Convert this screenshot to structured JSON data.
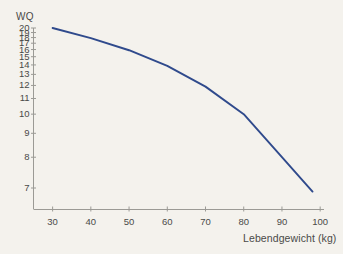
{
  "chart_data": {
    "type": "line",
    "title": "",
    "subtitle": "",
    "xlabel": "Lebendgewicht (kg)",
    "ylabel": "WQ",
    "xlim": [
      25,
      101
    ],
    "ylim": [
      6.5,
      20.4
    ],
    "grid": false,
    "legend": null,
    "y_scale": "reciprocal",
    "x_scale": "linear",
    "xticks": [
      30,
      40,
      50,
      60,
      70,
      80,
      90,
      100
    ],
    "xtick_labels": [
      "30",
      "40",
      "50",
      "60",
      "70",
      "80",
      "90",
      "100"
    ],
    "yticks": [
      20,
      19,
      18,
      17,
      16,
      15,
      14,
      13,
      12,
      11,
      10,
      9,
      8,
      7
    ],
    "ytick_labels": [
      "20",
      "19",
      "18",
      "17",
      "16",
      "15",
      "14",
      "13",
      "12",
      "11",
      "10",
      "9",
      "8",
      "7"
    ],
    "series": [
      {
        "name": "WQ",
        "color": "#2f4a8c",
        "x": [
          30,
          40,
          50,
          60,
          70,
          80,
          90,
          98
        ],
        "values": [
          20.0,
          17.9,
          15.9,
          13.9,
          11.9,
          10.0,
          8.0,
          6.9
        ]
      }
    ],
    "annotations": []
  },
  "axis": {
    "y_title": "WQ",
    "x_title": "Lebendgewicht (kg)"
  },
  "style": {
    "background": "#f4f2ed",
    "axis_color": "#9b9a95",
    "text_color": "#4a4a48",
    "line_color": "#2f4a8c"
  }
}
